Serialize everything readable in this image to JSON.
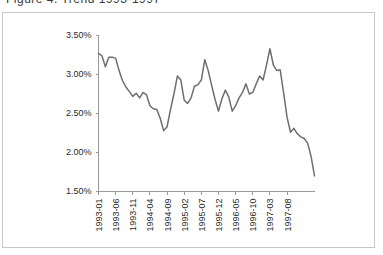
{
  "title": {
    "text": "Figure 4. Trend 1993-1997",
    "visible_note": "clipped-at-top-edge"
  },
  "colors": {
    "line": "#6e6e6e",
    "axis": "#9a9a9a",
    "frame": "#c8c8c8",
    "background": "#ffffff",
    "text": "#2b2b2b"
  },
  "chart_data": {
    "type": "line",
    "title": "",
    "xlabel": "",
    "ylabel": "",
    "grid": false,
    "legend": "none",
    "ylim": [
      1.5,
      3.5
    ],
    "ytick_values": [
      3.5,
      3.0,
      2.5,
      2.0,
      1.5
    ],
    "ytick_labels": [
      "3.50%",
      "3.00%",
      "2.50%",
      "2.00%",
      "1.50%"
    ],
    "xtick_labels": [
      "1993-01",
      "1993-06",
      "1993-11",
      "1994-04",
      "1994-09",
      "1995-02",
      "1995-07",
      "1995-12",
      "1996-05",
      "1996-10",
      "1997-03",
      "1997-08"
    ],
    "xtick_index": [
      0,
      5,
      10,
      15,
      20,
      25,
      30,
      35,
      40,
      45,
      50,
      55
    ],
    "x": [
      "1993-01",
      "1993-02",
      "1993-03",
      "1993-04",
      "1993-05",
      "1993-06",
      "1993-07",
      "1993-08",
      "1993-09",
      "1993-10",
      "1993-11",
      "1993-12",
      "1994-01",
      "1994-02",
      "1994-03",
      "1994-04",
      "1994-05",
      "1994-06",
      "1994-07",
      "1994-08",
      "1994-09",
      "1994-10",
      "1994-11",
      "1994-12",
      "1995-01",
      "1995-02",
      "1995-03",
      "1995-04",
      "1995-05",
      "1995-06",
      "1995-07",
      "1995-08",
      "1995-09",
      "1995-10",
      "1995-11",
      "1995-12",
      "1996-01",
      "1996-02",
      "1996-03",
      "1996-04",
      "1996-05",
      "1996-06",
      "1996-07",
      "1996-08",
      "1996-09",
      "1996-10",
      "1996-11",
      "1996-12",
      "1997-01",
      "1997-02",
      "1997-03",
      "1997-04",
      "1997-05",
      "1997-06",
      "1997-07",
      "1997-08",
      "1997-09",
      "1997-10",
      "1997-11",
      "1997-12"
    ],
    "values": [
      3.27,
      3.24,
      3.1,
      3.22,
      3.22,
      3.21,
      3.05,
      2.92,
      2.84,
      2.78,
      2.72,
      2.76,
      2.7,
      2.77,
      2.74,
      2.6,
      2.56,
      2.55,
      2.44,
      2.28,
      2.33,
      2.55,
      2.75,
      2.98,
      2.93,
      2.67,
      2.63,
      2.7,
      2.85,
      2.87,
      2.93,
      3.19,
      3.05,
      2.86,
      2.68,
      2.53,
      2.69,
      2.8,
      2.71,
      2.53,
      2.6,
      2.7,
      2.77,
      2.88,
      2.75,
      2.77,
      2.88,
      2.98,
      2.93,
      3.12,
      3.33,
      3.12,
      3.05,
      3.06,
      2.76,
      2.45,
      2.26,
      2.31,
      2.24,
      2.2
    ],
    "tail_values": [
      2.18,
      2.12,
      1.95,
      1.7
    ],
    "series_name": "rate",
    "unit": "%",
    "value_range_observed": [
      1.7,
      3.33
    ]
  }
}
